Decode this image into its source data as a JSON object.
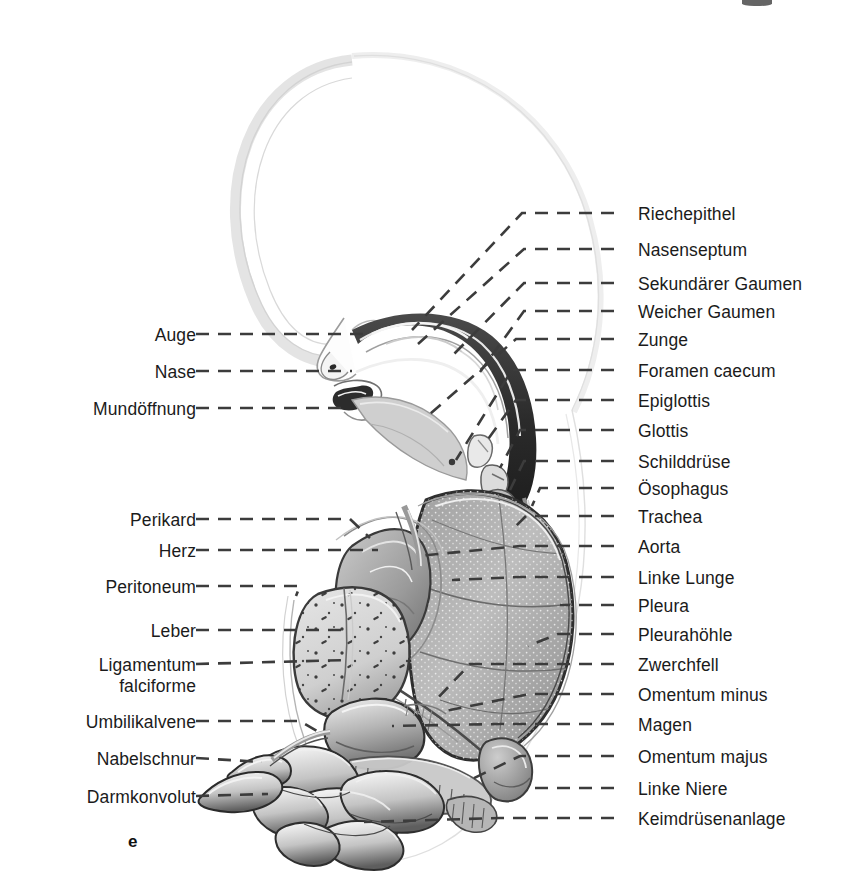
{
  "figure": {
    "marker": "e",
    "language": "de",
    "title_visible": false
  },
  "labels_left": [
    {
      "text": "Auge",
      "target": "eye"
    },
    {
      "text": "Nase",
      "target": "nose"
    },
    {
      "text": "Mundöffnung",
      "target": "mouth-opening"
    },
    {
      "text": "Perikard",
      "target": "pericardium"
    },
    {
      "text": "Herz",
      "target": "heart"
    },
    {
      "text": "Peritoneum",
      "target": "peritoneum"
    },
    {
      "text": "Leber",
      "target": "liver"
    },
    {
      "text": "Ligamentum\nfalciforme",
      "target": "falciform-ligament"
    },
    {
      "text": "Umbilikalvene",
      "target": "umbilical-vein"
    },
    {
      "text": "Nabelschnur",
      "target": "umbilical-cord"
    },
    {
      "text": "Darmkonvolut",
      "target": "intestinal-loops"
    }
  ],
  "labels_right": [
    {
      "text": "Riechepithel",
      "target": "olfactory-epithelium"
    },
    {
      "text": "Nasenseptum",
      "target": "nasal-septum"
    },
    {
      "text": "Sekundärer Gaumen",
      "target": "secondary-palate"
    },
    {
      "text": "Weicher Gaumen",
      "target": "soft-palate"
    },
    {
      "text": "Zunge",
      "target": "tongue"
    },
    {
      "text": "Foramen caecum",
      "target": "foramen-caecum"
    },
    {
      "text": "Epiglottis",
      "target": "epiglottis"
    },
    {
      "text": "Glottis",
      "target": "glottis"
    },
    {
      "text": "Schilddrüse",
      "target": "thyroid-gland"
    },
    {
      "text": "Ösophagus",
      "target": "esophagus"
    },
    {
      "text": "Trachea",
      "target": "trachea"
    },
    {
      "text": "Aorta",
      "target": "aorta"
    },
    {
      "text": "Linke Lunge",
      "target": "left-lung"
    },
    {
      "text": "Pleura",
      "target": "pleura"
    },
    {
      "text": "Pleurahöhle",
      "target": "pleural-cavity"
    },
    {
      "text": "Zwerchfell",
      "target": "diaphragm"
    },
    {
      "text": "Omentum minus",
      "target": "lesser-omentum"
    },
    {
      "text": "Magen",
      "target": "stomach"
    },
    {
      "text": "Omentum majus",
      "target": "greater-omentum"
    },
    {
      "text": "Linke Niere",
      "target": "left-kidney"
    },
    {
      "text": "Keimdrüsenanlage",
      "target": "gonadal-primordium"
    }
  ],
  "colors": {
    "background": "#ffffff",
    "text": "#1b1b1b",
    "leader_line": "#3c3c3c",
    "outline_faint": "#d8d8d8",
    "ink_dark": "#2a2a2a",
    "ink_mid": "#8d8d8d",
    "ink_light": "#cfcfcf"
  }
}
